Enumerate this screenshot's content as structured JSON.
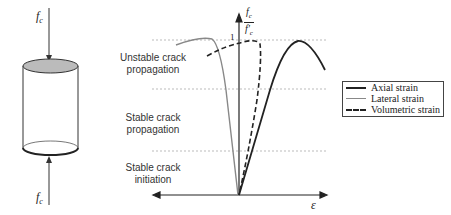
{
  "diagram": {
    "specimen": {
      "top_load_label": "f",
      "top_load_sub": "c",
      "bottom_load_label": "f",
      "bottom_load_sub": "c"
    },
    "y_axis": {
      "num": "f",
      "num_sub": "c",
      "den": "f'",
      "den_sub": "c",
      "tick_1": "1"
    },
    "x_axis": {
      "label": "ε"
    },
    "zones": [
      {
        "label_line1": "Unstable crack",
        "label_line2": "propagation"
      },
      {
        "label_line1": "Stable crack",
        "label_line2": "propagation"
      },
      {
        "label_line1": "Stable crack",
        "label_line2": "initiation"
      }
    ],
    "legend": [
      {
        "label": "Axial strain",
        "style": "solid",
        "color": "#222222"
      },
      {
        "label": "Lateral strain",
        "style": "solid",
        "color": "#888888"
      },
      {
        "label": "Volumetric strain",
        "style": "dashed",
        "color": "#222222"
      }
    ]
  }
}
